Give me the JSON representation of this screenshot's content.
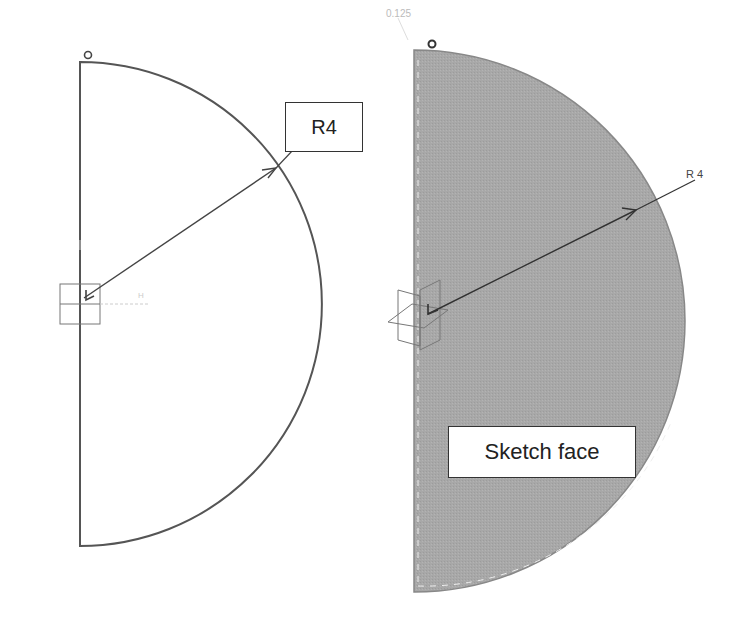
{
  "left_view": {
    "title": "2D sketch outline",
    "radius_callout": "R4",
    "shape": "semicircle",
    "center": [
      80,
      304
    ],
    "radius_px": 242
  },
  "right_view": {
    "title": "Filled sketch face",
    "radius_dimension": "R 4",
    "face_callout": "Sketch face",
    "faint_label": "0.125",
    "shape": "semicircle",
    "center": [
      414,
      321
    ],
    "radius_px": 271
  },
  "colors": {
    "line": "#555555",
    "face_fill": "#a9a9a9",
    "background": "#ffffff"
  }
}
